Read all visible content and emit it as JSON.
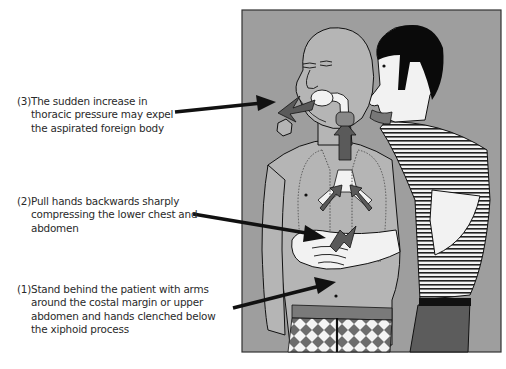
{
  "figure": {
    "panel_background": "#9e9e9e",
    "colors": {
      "skin_patient": "#b5b5b5",
      "skin_rescuer": "#f2f2f2",
      "hair": "#0a0a0a",
      "arrow_dark": "#5a5a5a",
      "callout_arrow": "#111111",
      "trousers": "#5c5c5c",
      "belt": "#7a7a7a"
    }
  },
  "steps": [
    {
      "number": "(1)",
      "lines": [
        "Stand behind the patient with arms",
        "around the costal margin or upper",
        "abdomen and hands clenched below",
        "the xiphoid process"
      ]
    },
    {
      "number": "(2)",
      "lines": [
        "Pull hands backwards sharply",
        "compressing the  lower chest and",
        "abdomen"
      ]
    },
    {
      "number": "(3)",
      "lines": [
        "The sudden increase in",
        "thoracic pressure may expel",
        "the aspirated foreign body"
      ]
    }
  ]
}
